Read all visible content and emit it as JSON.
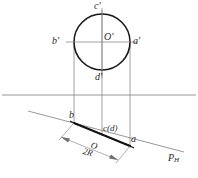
{
  "drawing": {
    "title": "Orthographic projection of a circle on an inclined plane",
    "colors": {
      "circle_stroke": "#1a1a1a",
      "thin_line": "#7a7a7a",
      "ground_line": "#8a8a8a",
      "thick_line": "#111111",
      "label_color": "#2b2b2b"
    },
    "front_view": {
      "circle": {
        "cx": 102,
        "cy": 42,
        "r": 28
      },
      "labels": {
        "top": "c'",
        "left": "b'",
        "center": "O'",
        "right": "a'",
        "bottom": "d'"
      }
    },
    "ground_line": {
      "y": 95,
      "x1": 2,
      "x2": 196
    },
    "top_view": {
      "trace_label": "P",
      "trace_label_sub": "H",
      "labels": {
        "left_point": "b",
        "coincident_points": "c(d)",
        "center": "O",
        "right_point": "a"
      },
      "dimension_label": "2R"
    },
    "projectors": [
      {
        "x": 74
      },
      {
        "x": 102
      },
      {
        "x": 130
      }
    ]
  }
}
